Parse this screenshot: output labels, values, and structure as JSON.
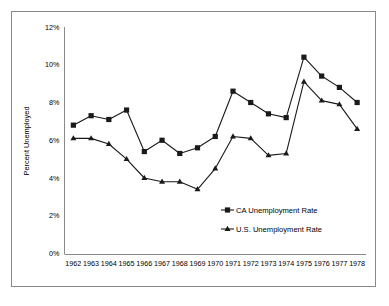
{
  "chart_data": {
    "type": "line",
    "title": "",
    "xlabel": "",
    "ylabel": "Percent Unemployed",
    "ylim": [
      0,
      12
    ],
    "ytick_labels": [
      "0%",
      "2%",
      "4%",
      "6%",
      "8%",
      "10%",
      "12%"
    ],
    "ytick_values": [
      0,
      2,
      4,
      6,
      8,
      10,
      12
    ],
    "grid": false,
    "legend_position": "inside-lower-right",
    "categories": [
      1962,
      1963,
      1964,
      1965,
      1966,
      1967,
      1968,
      1969,
      1970,
      1971,
      1972,
      1973,
      1974,
      1975,
      1976,
      1977,
      1978
    ],
    "xtick_labels": [
      "1962",
      "1963",
      "1964",
      "1965",
      "1966",
      "1967",
      "1968",
      "1969",
      "1970",
      "1971",
      "1972",
      "1973",
      "1974",
      "1975",
      "1976",
      "1977",
      "1978"
    ],
    "series": [
      {
        "name": "CA Unemployment Rate",
        "marker": "square",
        "color": "#1a1a1a",
        "values": [
          6.8,
          7.3,
          7.1,
          7.6,
          5.4,
          6.0,
          5.3,
          5.6,
          6.2,
          8.6,
          8.0,
          7.4,
          7.2,
          10.4,
          9.4,
          8.8,
          8.0
        ]
      },
      {
        "name": "U.S. Unemployment Rate",
        "marker": "triangle",
        "color": "#1a1a1a",
        "values": [
          6.1,
          6.1,
          5.8,
          5.0,
          4.0,
          3.8,
          3.8,
          3.4,
          4.5,
          6.2,
          6.1,
          5.2,
          5.3,
          9.1,
          8.1,
          7.9,
          6.6
        ]
      }
    ]
  },
  "axes": {
    "y_axis_title": "Percent Unemployed"
  },
  "legend": {
    "items": [
      {
        "label": "CA Unemployment Rate",
        "marker": "square"
      },
      {
        "label": "U.S. Unemployment Rate",
        "marker": "triangle"
      }
    ]
  }
}
